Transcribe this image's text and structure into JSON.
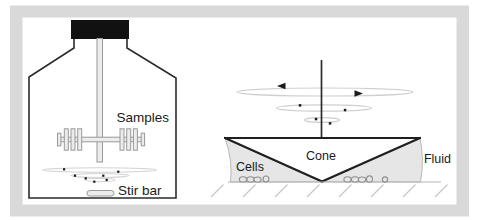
{
  "labels": {
    "samples": "Samples",
    "stir_bar": "Stir bar",
    "cone": "Cone",
    "cells": "Cells",
    "fluid": "Fluid"
  },
  "colors": {
    "frame": "#d9d9d9",
    "background": "#ffffff",
    "dark_outline": "#2b2b2b",
    "cap_black": "#111111",
    "hardware_fill": "#ececec",
    "hardware_stroke": "#9a9a9a",
    "fluid_fill": "#e6e6e6",
    "swirl_stroke": "#cfcfcf",
    "plate_stroke": "#b5b5b5",
    "text": "#1a1a1a"
  }
}
